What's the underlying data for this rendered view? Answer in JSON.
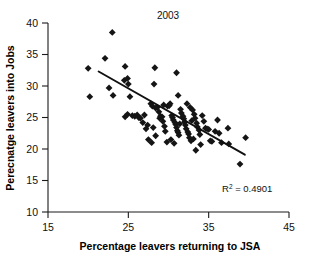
{
  "chart_data": {
    "type": "scatter",
    "title": "2003",
    "xlabel": "Percentage leavers returning to JSA",
    "ylabel": "Perecnatge leavers into Jobs",
    "xlim": [
      15,
      45
    ],
    "ylim": [
      10,
      40
    ],
    "xticks": [
      15,
      25,
      35,
      45
    ],
    "yticks": [
      10,
      15,
      20,
      25,
      30,
      35,
      40
    ],
    "grid": false,
    "legend": null,
    "annotation": "R² = 0.4901",
    "annotation_label": "R",
    "annotation_sup": "2",
    "annotation_value": " = 0.4901",
    "r_squared": 0.4901,
    "trendline": {
      "type": "linear",
      "x_start": 21.3,
      "y_start": 32.3,
      "x_end": 39.5,
      "y_end": 19.1
    },
    "marker": {
      "shape": "diamond",
      "color": "#151515",
      "size": 3.4
    },
    "points": [
      [
        20.0,
        32.8
      ],
      [
        20.2,
        28.3
      ],
      [
        22.1,
        34.4
      ],
      [
        23.0,
        38.5
      ],
      [
        22.6,
        29.7
      ],
      [
        23.1,
        28.5
      ],
      [
        24.6,
        33.1
      ],
      [
        24.5,
        30.9
      ],
      [
        24.9,
        31.2
      ],
      [
        25.0,
        30.3
      ],
      [
        25.2,
        28.3
      ],
      [
        24.6,
        25.1
      ],
      [
        24.9,
        25.5
      ],
      [
        25.5,
        25.3
      ],
      [
        25.8,
        25.2
      ],
      [
        26.1,
        25.4
      ],
      [
        26.3,
        25.0
      ],
      [
        27.0,
        25.4
      ],
      [
        27.4,
        23.8
      ],
      [
        27.2,
        23.2
      ],
      [
        27.5,
        21.5
      ],
      [
        27.9,
        21.0
      ],
      [
        27.8,
        27.2
      ],
      [
        28.0,
        26.8
      ],
      [
        28.2,
        30.3
      ],
      [
        28.3,
        32.9
      ],
      [
        28.4,
        26.5
      ],
      [
        28.6,
        26.6
      ],
      [
        28.8,
        25.9
      ],
      [
        28.9,
        24.9
      ],
      [
        29.0,
        25.2
      ],
      [
        29.2,
        25.1
      ],
      [
        29.3,
        24.4
      ],
      [
        29.5,
        23.6
      ],
      [
        29.6,
        22.8
      ],
      [
        29.8,
        21.1
      ],
      [
        29.9,
        26.8
      ],
      [
        30.1,
        26.9
      ],
      [
        30.2,
        27.2
      ],
      [
        30.4,
        25.3
      ],
      [
        30.5,
        25.0
      ],
      [
        30.6,
        24.6
      ],
      [
        30.8,
        24.2
      ],
      [
        30.9,
        23.9
      ],
      [
        31.0,
        23.4
      ],
      [
        31.1,
        22.9
      ],
      [
        31.2,
        22.6
      ],
      [
        31.3,
        22.2
      ],
      [
        31.0,
        32.1
      ],
      [
        31.2,
        28.5
      ],
      [
        31.5,
        26.3
      ],
      [
        31.6,
        25.7
      ],
      [
        31.8,
        25.2
      ],
      [
        31.9,
        24.8
      ],
      [
        32.0,
        24.3
      ],
      [
        32.1,
        23.8
      ],
      [
        32.2,
        23.2
      ],
      [
        32.4,
        22.7
      ],
      [
        32.5,
        22.4
      ],
      [
        32.6,
        21.8
      ],
      [
        32.8,
        21.3
      ],
      [
        32.3,
        27.2
      ],
      [
        32.7,
        26.6
      ],
      [
        33.0,
        26.2
      ],
      [
        33.2,
        25.5
      ],
      [
        33.3,
        24.9
      ],
      [
        33.5,
        24.1
      ],
      [
        33.6,
        23.5
      ],
      [
        33.8,
        23.0
      ],
      [
        33.9,
        22.3
      ],
      [
        33.4,
        19.8
      ],
      [
        34.2,
        25.3
      ],
      [
        34.4,
        24.4
      ],
      [
        34.6,
        23.3
      ],
      [
        34.8,
        23.2
      ],
      [
        35.0,
        23.1
      ],
      [
        35.2,
        21.3
      ],
      [
        35.4,
        21.2
      ],
      [
        36.1,
        24.6
      ],
      [
        36.3,
        22.5
      ],
      [
        36.6,
        21.0
      ],
      [
        37.4,
        23.3
      ],
      [
        37.5,
        20.8
      ],
      [
        38.9,
        17.6
      ],
      [
        39.6,
        21.8
      ],
      [
        26.5,
        24.9
      ],
      [
        26.8,
        24.2
      ],
      [
        28.1,
        23.4
      ],
      [
        28.4,
        22.1
      ],
      [
        30.3,
        21.5
      ],
      [
        30.7,
        20.9
      ],
      [
        29.4,
        27.0
      ],
      [
        31.4,
        24.0
      ],
      [
        32.9,
        24.5
      ],
      [
        33.1,
        21.6
      ],
      [
        34.0,
        20.7
      ],
      [
        35.8,
        22.8
      ]
    ]
  }
}
